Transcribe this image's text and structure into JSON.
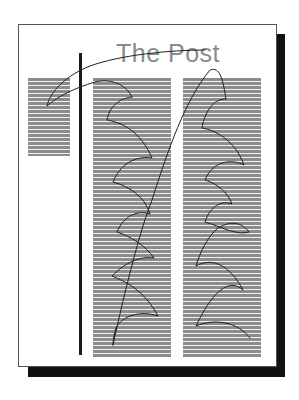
{
  "diagram": {
    "type": "newspaper page reading-path diagram",
    "title": "The Post",
    "colors": {
      "title": "#8a8a8a",
      "text_lines": "#8c8c8c",
      "rule": "#1a1a1a",
      "shadow": "#111111",
      "path": "#222222"
    },
    "columns": [
      {
        "name": "left-column",
        "lines": 20
      },
      {
        "name": "middle-column",
        "lines": 70
      },
      {
        "name": "right-column",
        "lines": 70
      }
    ],
    "reading_path": {
      "description": "Eye path starts near headline, sweeps to left column, then zigzags down middle column, jumps diagonally to top of right column and zigzags down it"
    }
  }
}
